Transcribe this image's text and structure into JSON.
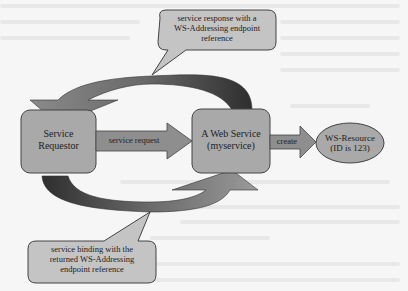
{
  "diagram": {
    "nodes": {
      "requestor": {
        "line1": "Service",
        "line2": "Requestor"
      },
      "web_service": {
        "line1": "A Web Service",
        "line2": "(myservice)"
      },
      "ws_resource": {
        "line1": "WS-Resource",
        "line2": "(ID is 123)"
      }
    },
    "edges": {
      "request": "service request",
      "create": "create"
    },
    "callouts": {
      "response": {
        "line1": "service response with a",
        "line2": "WS-Addressing endpoint",
        "line3": "reference"
      },
      "binding": {
        "line1": "service binding with the",
        "line2": "returned WS-Addressing",
        "line3": "endpoint reference"
      }
    },
    "colors": {
      "box_fill": "#a9a9a9",
      "callout_fill": "#c4c4c4",
      "arrow_fill": "#8e8e8e",
      "curve_dark": "#3c3c3c",
      "background": "#f6f6f6"
    }
  }
}
